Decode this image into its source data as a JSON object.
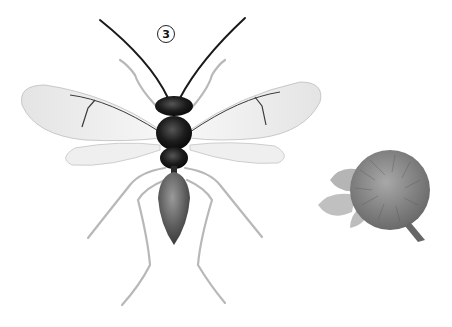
{
  "figure": {
    "label": "3",
    "subjects": [
      "wasp-specimen",
      "plant-gall-specimen"
    ]
  },
  "colors": {
    "background": "#ffffff",
    "body_dark": "#1a1a1a",
    "abdomen": "#555555",
    "wing_fill": "#ececec",
    "wing_vein": "#3a3a3a",
    "leg": "#c8c8c8",
    "gall": "#8a8a8a",
    "leaf": "#b5b5b5"
  }
}
